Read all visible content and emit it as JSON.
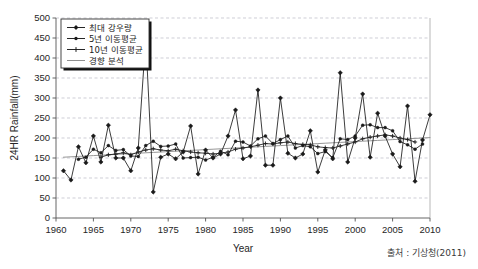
{
  "figure": {
    "source_note": "출처 : 기상청(2011)"
  },
  "chart_data": {
    "type": "line",
    "title": "",
    "xlabel": "Year",
    "ylabel": "24HR Rainfall(mm)",
    "xlim": [
      1960,
      2010
    ],
    "ylim": [
      0,
      500
    ],
    "xticks": [
      1960,
      1965,
      1970,
      1975,
      1980,
      1985,
      1990,
      1995,
      2000,
      2005,
      2010
    ],
    "yticks": [
      0,
      50,
      100,
      150,
      200,
      250,
      300,
      350,
      400,
      450,
      500
    ],
    "xtick_labels": [
      "1960",
      "1965",
      "1970",
      "1975",
      "1980",
      "1985",
      "1990",
      "1995",
      "2000",
      "2005",
      "2010"
    ],
    "ytick_labels": [
      "0",
      "50",
      "100",
      "150",
      "200",
      "250",
      "300",
      "350",
      "400",
      "450",
      "500"
    ],
    "grid": "horizontal-dashed",
    "legend_position": "top-left",
    "x": [
      1961,
      1962,
      1963,
      1964,
      1965,
      1966,
      1967,
      1968,
      1969,
      1970,
      1971,
      1972,
      1973,
      1974,
      1975,
      1976,
      1977,
      1978,
      1979,
      1980,
      1981,
      1982,
      1983,
      1984,
      1985,
      1986,
      1987,
      1988,
      1989,
      1990,
      1991,
      1992,
      1993,
      1994,
      1995,
      1996,
      1997,
      1998,
      1999,
      2000,
      2001,
      2002,
      2003,
      2004,
      2005,
      2006,
      2007,
      2008,
      2009,
      2010
    ],
    "series": [
      {
        "name": "최대 강우량",
        "key": "max_rainfall",
        "color": "#1a1a1a",
        "marker": "diamond",
        "values": [
          118,
          95,
          178,
          138,
          205,
          140,
          232,
          150,
          150,
          118,
          175,
          450,
          65,
          152,
          160,
          148,
          165,
          230,
          110,
          170,
          150,
          160,
          205,
          270,
          148,
          155,
          320,
          132,
          132,
          300,
          162,
          150,
          160,
          218,
          115,
          170,
          148,
          363,
          140,
          200,
          310,
          152,
          262,
          205,
          160,
          128,
          280,
          92,
          195,
          258
        ]
      },
      {
        "name": "5년 이동평균",
        "key": "ma5",
        "color": "#1a1a1a",
        "marker": "dot",
        "values": [
          null,
          null,
          147,
          152,
          172,
          163,
          181,
          169,
          171,
          155,
          154,
          181,
          192,
          179,
          180,
          185,
          150,
          151,
          152,
          145,
          152,
          167,
          158,
          192,
          190,
          180,
          198,
          205,
          186,
          196,
          205,
          175,
          181,
          178,
          161,
          166,
          151,
          198,
          196,
          205,
          232,
          233,
          226,
          226,
          218,
          191,
          183,
          172,
          185,
          null
        ]
      },
      {
        "name": "10년 이동평균",
        "key": "ma10",
        "color": "#1a1a1a",
        "marker": "plus",
        "values": [
          null,
          null,
          null,
          null,
          null,
          152,
          158,
          160,
          163,
          158,
          165,
          170,
          173,
          170,
          168,
          172,
          168,
          165,
          163,
          162,
          160,
          162,
          165,
          172,
          175,
          178,
          182,
          186,
          185,
          188,
          190,
          186,
          184,
          183,
          178,
          176,
          175,
          180,
          185,
          190,
          198,
          202,
          205,
          208,
          205,
          200,
          196,
          190,
          null,
          null
        ]
      },
      {
        "name": "경향 분석",
        "key": "trend",
        "color": "#8a8a8a",
        "marker": "none",
        "values": [
          152,
          153,
          154,
          155,
          156,
          157,
          158,
          159,
          160,
          161,
          162,
          163,
          164,
          165,
          166,
          167,
          168,
          169,
          170,
          171,
          172,
          173,
          174,
          175,
          176,
          177,
          178,
          179,
          180,
          181,
          182,
          183,
          184,
          185,
          186,
          187,
          188,
          189,
          190,
          191,
          192,
          193,
          194,
          195,
          196,
          197,
          198,
          199,
          200,
          201
        ]
      }
    ]
  },
  "legend": {
    "items": [
      {
        "label": "최대 강우량",
        "marker": "diamond-line"
      },
      {
        "label": "5년 이동평균",
        "marker": "dot-line"
      },
      {
        "label": "10년 이동평균",
        "marker": "plus-line"
      },
      {
        "label": "경향 분석",
        "marker": "plain-line"
      }
    ]
  }
}
